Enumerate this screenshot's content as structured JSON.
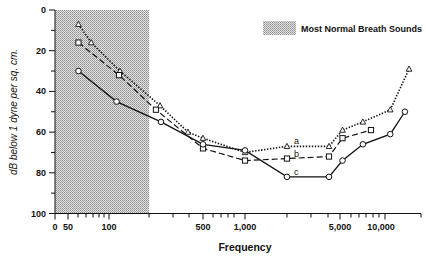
{
  "chart_data": {
    "type": "line",
    "title": "",
    "xlabel": "Frequency",
    "ylabel": "dB below 1 dyne per sq. cm.",
    "xscale": "log",
    "x_tick_labels": [
      "0",
      "50",
      "100",
      "500",
      "1,000",
      "5,000",
      "10,000"
    ],
    "y_tick_labels": [
      "0",
      "20",
      "40",
      "60",
      "80",
      "100"
    ],
    "ylim": [
      0,
      100
    ],
    "y_inverted": true,
    "grid": false,
    "legend": {
      "position": "upper right",
      "entries": [
        {
          "label": "Most Normal Breath Sounds",
          "type": "shaded-region",
          "x_range": [
            0,
            200
          ]
        }
      ]
    },
    "series": [
      {
        "name": "a",
        "marker": "triangle",
        "line": "dotted",
        "x": [
          64,
          79,
          127,
          246,
          390,
          500,
          1000,
          2000,
          4000,
          5000,
          7000,
          11000,
          15000
        ],
        "y": [
          7,
          16,
          30,
          47,
          60,
          63,
          70,
          67,
          67,
          59,
          55,
          49,
          29
        ]
      },
      {
        "name": "b",
        "marker": "square",
        "line": "dashed",
        "x": [
          64,
          125,
          230,
          500,
          1000,
          2000,
          4000,
          5000,
          8000
        ],
        "y": [
          16,
          32,
          49,
          68,
          74,
          73,
          72,
          63,
          59
        ]
      },
      {
        "name": "c",
        "marker": "circle",
        "line": "solid",
        "x": [
          64,
          120,
          250,
          500,
          1000,
          2000,
          4000,
          5000,
          7000,
          11000,
          14000
        ],
        "y": [
          30,
          45,
          55,
          66,
          69,
          82,
          82,
          74,
          66,
          61,
          50
        ]
      }
    ],
    "annotations": [
      {
        "text": "a",
        "x": 2100,
        "y": 66
      },
      {
        "text": "b",
        "x": 2100,
        "y": 72
      },
      {
        "text": "c",
        "x": 2100,
        "y": 81
      }
    ]
  },
  "legend_label": "Most Normal Breath Sounds",
  "xlabel": "Frequency",
  "ylabel": "dB below 1 dyne per sq. cm."
}
